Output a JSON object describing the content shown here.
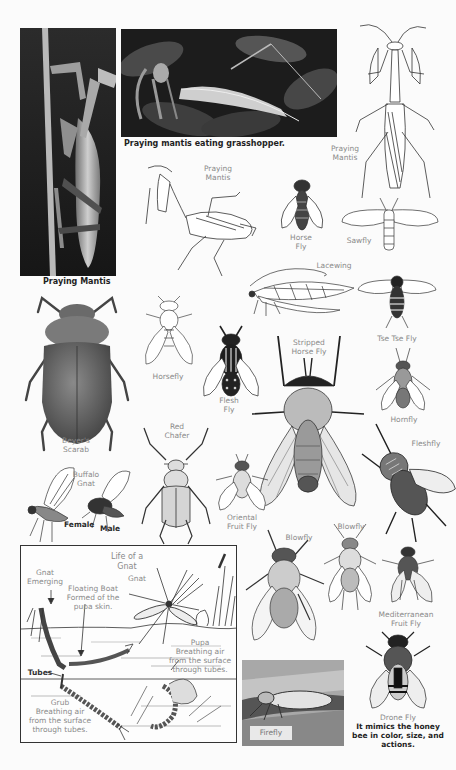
{
  "page": {
    "background": "#fbfbfb",
    "ink_color": "#2a2a2a",
    "label_color": "#8a8a8a"
  },
  "photos": {
    "praying_mantis": {
      "caption": "Praying Mantis"
    },
    "mantis_eating": {
      "caption": "Praying mantis eating grasshopper."
    },
    "firefly": {
      "caption": "Firefly"
    }
  },
  "labels": {
    "praying_mantis_sketch": "Praying\nMantis",
    "praying_mantis_right": "Praying\nMantis",
    "horse_fly": "Horse\nFly",
    "sawfly": "Sawfly",
    "lacewing": "Lacewing",
    "horsefly": "Horsefly",
    "flesh_fly": "Flesh\nFly",
    "stripped_horse_fly": "Stripped\nHorse Fly",
    "tse_tse_fly": "Tse Tse Fly",
    "hornfly": "Hornfly",
    "fleshfly": "Fleshfly",
    "beyers_scarab": "Beyer's\nScarab",
    "red_chafer": "Red\nChafer",
    "buffalo_gnat": "Buffalo\nGnat",
    "female": "Female",
    "male": "Male",
    "oriental_fruit_fly": "Oriental\nFruit Fly",
    "blowfly_left": "Blowfly",
    "blowfly_right": "Blowfly",
    "mediterranean_fruit_fly": "Mediterranean\nFruit Fly",
    "drone_fly": "Drone Fly",
    "drone_fly_note": "It mimics the honey\nbee in color, size, and\nactions."
  },
  "gnat_diagram": {
    "title": "Life of a\nGnat",
    "gnat_emerging": "Gnat\nEmerging",
    "gnat": "Gnat",
    "floating_boat": "Floating Boat\nFormed of the\npupa skin.",
    "pupa": "Pupa\nBreathing air\nfrom the surface\nthrough tubes.",
    "tubes": "Tubes",
    "grub": "Grub\nBreathing air\nfrom the surface\nthrough tubes."
  }
}
